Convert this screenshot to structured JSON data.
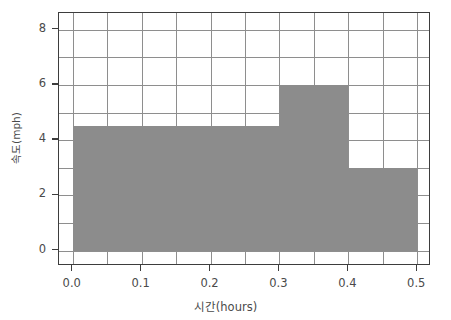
{
  "chart_data": {
    "type": "bar",
    "title": "",
    "subtitle": "",
    "xlabel": "시간(hours)",
    "ylabel": "속도(mph)",
    "xlim": [
      -0.02,
      0.52
    ],
    "ylim": [
      -0.55,
      8.6
    ],
    "xticks": [
      0.0,
      0.1,
      0.2,
      0.3,
      0.4,
      0.5
    ],
    "xticklabels": [
      "0.0",
      "0.1",
      "0.2",
      "0.3",
      "0.4",
      "0.5"
    ],
    "yticks": [
      0,
      2,
      4,
      6,
      8
    ],
    "yticklabels": [
      "0",
      "2",
      "4",
      "6",
      "8"
    ],
    "x_minor_gridlines": [
      0.05,
      0.15,
      0.25,
      0.35,
      0.45
    ],
    "y_minor_gridlines": [
      1,
      3,
      5,
      7
    ],
    "grid": true,
    "legend": false,
    "bar_color": "#8c8c8c",
    "frame_color": "#3d3d3d",
    "grid_color": "#8e8e8e",
    "bars": [
      {
        "label": "0.0-0.3",
        "x_start": 0.0,
        "x_end": 0.3,
        "value": 4.5
      },
      {
        "label": "0.3-0.4",
        "x_start": 0.3,
        "x_end": 0.4,
        "value": 6.0
      },
      {
        "label": "0.4-0.5",
        "x_start": 0.4,
        "x_end": 0.5,
        "value": 3.0
      }
    ],
    "categories": [
      "0.0-0.3",
      "0.3-0.4",
      "0.4-0.5"
    ],
    "values": [
      4.5,
      6.0,
      3.0
    ]
  }
}
